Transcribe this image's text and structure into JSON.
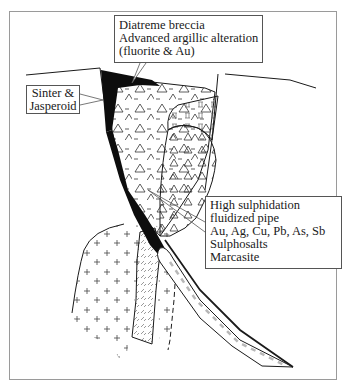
{
  "diagram": {
    "type": "geological-cross-section",
    "labels": {
      "diatreme": {
        "lines": [
          "Diatreme breccia",
          "Advanced argillic alteration",
          "(fluorite & Au)"
        ]
      },
      "sinter": {
        "lines": [
          "Sinter &",
          "Jasperoid"
        ]
      },
      "pipe": {
        "lines": [
          "High sulphidation",
          "fluidized pipe",
          "Au, Ag, Cu, Pb, As, Sb",
          "Sulphosalts",
          "Marcasite"
        ]
      }
    },
    "units": [
      {
        "name": "diatreme-breccia",
        "pattern": "triangles-and-dashes"
      },
      {
        "name": "argillic-zone",
        "pattern": "roman-II-symbols"
      },
      {
        "name": "breccia-lobe",
        "pattern": "triangles"
      },
      {
        "name": "intrusion",
        "pattern": "plus-signs"
      },
      {
        "name": "dyke",
        "pattern": "hatch-dashes"
      },
      {
        "name": "sinter-jasperoid",
        "pattern": "solid-black"
      },
      {
        "name": "fluidized-pipe",
        "pattern": "grey-dashes"
      }
    ],
    "colors": {
      "line": "#1a1a1a",
      "frame": "#9a9a9a",
      "fill_black": "#0d0d0d",
      "pipe_dash": "#b8b8b8"
    }
  }
}
